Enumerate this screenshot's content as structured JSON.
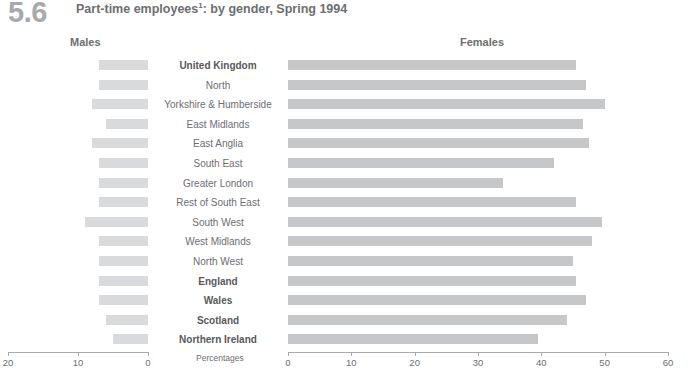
{
  "figure": {
    "number": "5.6",
    "title": "Part-time employees",
    "title_superscript": "1",
    "title_rest": ": by gender, Spring 1994",
    "males_heading": "Males",
    "females_heading": "Females",
    "percentages_label": "Percentages"
  },
  "chart_data": {
    "type": "bar",
    "orientation": "horizontal",
    "style": "bidirectional-pyramid",
    "xlabel": "Percentages",
    "ylabel": "",
    "categories": [
      "United Kingdom",
      "North",
      "Yorkshire & Humberside",
      "East Midlands",
      "East Anglia",
      "South East",
      "Greater London",
      "Rest of South East",
      "South West",
      "West Midlands",
      "North West",
      "England",
      "Wales",
      "Scotland",
      "Northern Ireland"
    ],
    "bold_categories": [
      "United Kingdom",
      "England",
      "Wales",
      "Scotland",
      "Northern Ireland"
    ],
    "series": [
      {
        "name": "Males",
        "side": "left",
        "xlim": [
          20,
          0
        ],
        "ticks": [
          20,
          10,
          0
        ],
        "values": [
          7,
          7,
          8,
          6,
          8,
          7,
          7,
          7,
          9,
          7,
          7,
          7,
          7,
          6,
          5
        ]
      },
      {
        "name": "Females",
        "side": "right",
        "xlim": [
          0,
          60
        ],
        "ticks": [
          0,
          10,
          20,
          30,
          40,
          50,
          60
        ],
        "values": [
          45.5,
          47,
          50,
          46.5,
          47.5,
          42,
          34,
          45.5,
          49.5,
          48,
          45,
          45.5,
          47,
          44,
          39.5
        ]
      }
    ],
    "grid": false,
    "legend": "column-headings"
  },
  "colors": {
    "male_bar": "#d9dadb",
    "female_bar": "#c6c7c9",
    "text": "#6d6e71",
    "figure_number": "#a7a9ac",
    "axis": "#a7a9ac"
  }
}
